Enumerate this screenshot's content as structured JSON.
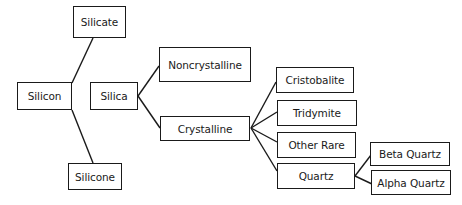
{
  "diagram": {
    "type": "tree",
    "nodes": [
      {
        "id": "silicate",
        "label": "Silicate",
        "x": 73,
        "y": 6,
        "w": 53,
        "h": 32
      },
      {
        "id": "silicon",
        "label": "Silicon",
        "x": 17,
        "y": 82,
        "w": 55,
        "h": 28
      },
      {
        "id": "silicone",
        "label": "Silicone",
        "x": 68,
        "y": 163,
        "w": 54,
        "h": 27
      },
      {
        "id": "silica",
        "label": "Silica",
        "x": 90,
        "y": 82,
        "w": 48,
        "h": 28
      },
      {
        "id": "noncrystalline",
        "label": "Noncrystalline",
        "x": 159,
        "y": 47,
        "w": 92,
        "h": 35
      },
      {
        "id": "crystalline",
        "label": "Crystalline",
        "x": 160,
        "y": 116,
        "w": 90,
        "h": 25
      },
      {
        "id": "cristobalite",
        "label": "Cristobalite",
        "x": 276,
        "y": 67,
        "w": 78,
        "h": 26
      },
      {
        "id": "tridymite",
        "label": "Tridymite",
        "x": 277,
        "y": 100,
        "w": 80,
        "h": 26
      },
      {
        "id": "other-rare",
        "label": "Other Rare",
        "x": 277,
        "y": 132,
        "w": 79,
        "h": 26
      },
      {
        "id": "quartz",
        "label": "Quartz",
        "x": 277,
        "y": 163,
        "w": 78,
        "h": 26
      },
      {
        "id": "beta-quartz",
        "label": "Beta Quartz",
        "x": 370,
        "y": 142,
        "w": 80,
        "h": 24
      },
      {
        "id": "alpha-quartz",
        "label": "Alpha Quartz",
        "x": 371,
        "y": 170,
        "w": 80,
        "h": 25
      }
    ],
    "edges": [
      {
        "from": "silicon",
        "to": "silicate",
        "x1": 72,
        "y1": 83,
        "x2": 93,
        "y2": 38
      },
      {
        "from": "silicon",
        "to": "silicone",
        "x1": 72,
        "y1": 110,
        "x2": 93,
        "y2": 163
      },
      {
        "from": "silica",
        "to": "noncrystalline",
        "x1": 138,
        "y1": 96,
        "x2": 159,
        "y2": 66
      },
      {
        "from": "silica",
        "to": "crystalline",
        "x1": 138,
        "y1": 96,
        "x2": 160,
        "y2": 128
      },
      {
        "from": "crystalline",
        "to": "cristobalite",
        "x1": 251,
        "y1": 128,
        "x2": 276,
        "y2": 82
      },
      {
        "from": "crystalline",
        "to": "tridymite",
        "x1": 251,
        "y1": 128,
        "x2": 277,
        "y2": 112
      },
      {
        "from": "crystalline",
        "to": "other-rare",
        "x1": 251,
        "y1": 128,
        "x2": 277,
        "y2": 142
      },
      {
        "from": "crystalline",
        "to": "quartz",
        "x1": 251,
        "y1": 128,
        "x2": 277,
        "y2": 171
      },
      {
        "from": "quartz",
        "to": "beta-quartz",
        "x1": 355,
        "y1": 176,
        "x2": 371,
        "y2": 155
      },
      {
        "from": "quartz",
        "to": "alpha-quartz",
        "x1": 355,
        "y1": 176,
        "x2": 372,
        "y2": 184
      }
    ]
  }
}
